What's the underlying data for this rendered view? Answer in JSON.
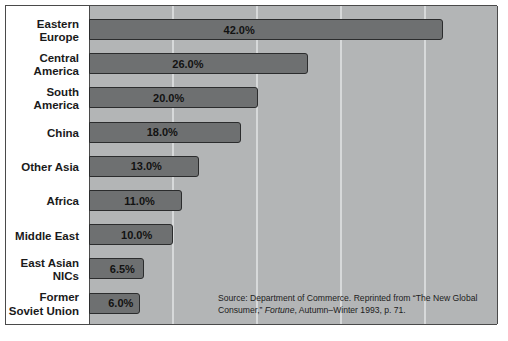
{
  "chart_data": {
    "type": "bar",
    "orientation": "horizontal",
    "title": "",
    "subtitle": "",
    "xlabel": "",
    "ylabel": "",
    "categories": [
      "Eastern Europe",
      "Central America",
      "South America",
      "China",
      "Other Asia",
      "Africa",
      "Middle East",
      "East Asian NICs",
      "Former Soviet Union"
    ],
    "values": [
      42.0,
      26.0,
      20.0,
      18.0,
      13.0,
      11.0,
      10.0,
      6.5,
      6.0
    ],
    "value_labels": [
      "42.0%",
      "26.0%",
      "20.0%",
      "18.0%",
      "13.0%",
      "11.0%",
      "10.0%",
      "6.5%",
      "6.0%"
    ],
    "xlim": [
      0,
      48.5
    ],
    "gridlines": [
      10,
      20,
      30,
      40
    ],
    "grid": true,
    "legend": "none",
    "annotations": [
      "Source: Department of Commerce. Reprinted from “The New Global Consumer,” Fortune, Autumn–Winter 1993, p. 71."
    ],
    "colors": {
      "bar_fill": "#6e7071",
      "bar_border": "#2b2c2d",
      "bar_shadow": "#404243",
      "plot_background": "#b3b5b6",
      "gridline": "#d7d9da",
      "frame": "#4a4a4a",
      "label_text": "#1a1a1a"
    }
  },
  "categories": [
    {
      "line1": "Eastern",
      "line2": "Europe",
      "value_label": "42.0%"
    },
    {
      "line1": "Central",
      "line2": "America",
      "value_label": "26.0%"
    },
    {
      "line1": "South",
      "line2": "America",
      "value_label": "20.0%"
    },
    {
      "line1": "China",
      "line2": "",
      "value_label": "18.0%"
    },
    {
      "line1": "Other Asia",
      "line2": "",
      "value_label": "13.0%"
    },
    {
      "line1": "Africa",
      "line2": "",
      "value_label": "11.0%"
    },
    {
      "line1": "Middle East",
      "line2": "",
      "value_label": "10.0%"
    },
    {
      "line1": "East Asian",
      "line2": "NICs",
      "value_label": "6.5%"
    },
    {
      "line1": "Former",
      "line2": "Soviet Union",
      "value_label": "6.0%"
    }
  ],
  "source": {
    "line1": "Source: Department of Commerce. Reprinted from “The New Global",
    "part_a": "Consumer,” ",
    "publication": "Fortune",
    "part_b": ", Autumn–Winter 1993, p. 71."
  }
}
